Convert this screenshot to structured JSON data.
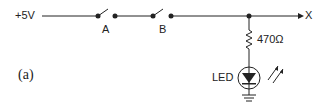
{
  "labels": {
    "supply": "+5V",
    "switch_a": "A",
    "switch_b": "B",
    "output": "X",
    "resistor": "470Ω",
    "led": "LED",
    "figure": "(a)"
  },
  "colors": {
    "stroke": "#222222",
    "background": "#ffffff"
  }
}
